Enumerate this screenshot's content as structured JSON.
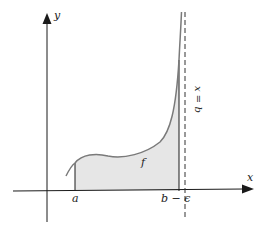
{
  "diagram": {
    "labels": {
      "y_axis": "y",
      "x_axis": "x",
      "lower_limit": "a",
      "upper_limit": "b − ϵ",
      "function": "f",
      "asymptote": "x = b"
    },
    "colors": {
      "axis": "#1a1a1a",
      "curve": "#7a7a7a",
      "shade": "#e6e6e6",
      "asymptote": "#333333"
    }
  }
}
